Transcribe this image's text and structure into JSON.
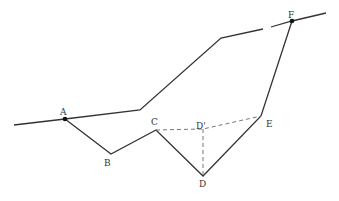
{
  "diagram": {
    "colors": {
      "line": "#333333",
      "dashed": "#777777",
      "background": "#ffffff"
    },
    "points": {
      "A": {
        "label": "A",
        "x": 65,
        "y": 119
      },
      "B": {
        "label": "B",
        "x": 111,
        "y": 154
      },
      "C": {
        "label": "C",
        "x": 156,
        "y": 130
      },
      "D_prime": {
        "label": "D'",
        "x": 203,
        "y": 129
      },
      "D": {
        "label": "D",
        "x": 203,
        "y": 176
      },
      "E": {
        "label": "E",
        "x": 261,
        "y": 116
      },
      "F": {
        "label": "F",
        "x": 292,
        "y": 21
      }
    },
    "solid_paths": [
      "upper-line: (14,125) → A → (140,110) → (221,38) → F → (326,13)",
      "lower-route: A → B → C → D → E → F"
    ],
    "dashed_paths": [
      "C → D' → E",
      "D' → D"
    ]
  }
}
